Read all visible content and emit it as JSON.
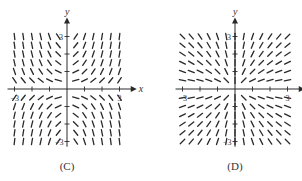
{
  "figure": {
    "panels": [
      {
        "id": "C",
        "caption": "(C)",
        "x_axis_label": "x",
        "y_axis_label": "y",
        "tick_labels": {
          "x_neg": "−3",
          "x_pos": "3",
          "y_pos": "3",
          "y_neg": "−3"
        },
        "field": "xy",
        "origin": [
          67,
          89
        ],
        "unit_px": 17.5,
        "grid_cols": [
          -3,
          -2.5,
          -2,
          -1.5,
          -1,
          -0.5,
          0.5,
          1,
          1.5,
          2,
          2.5,
          3
        ],
        "grid_rows": [
          3,
          2.5,
          2,
          1.5,
          1,
          0.5,
          -0.5,
          -1,
          -1.5,
          -2,
          -2.5,
          -3
        ]
      },
      {
        "id": "D",
        "caption": "(D)",
        "x_axis_label": "x",
        "y_axis_label": "y",
        "tick_labels": {
          "x_neg": "−3",
          "x_pos": "3",
          "y_pos": "3",
          "y_neg": "−3"
        },
        "field": "y_over_x",
        "origin": [
          84,
          89
        ],
        "unit_px": 17.5,
        "grid_cols": [
          -3,
          -2.5,
          -2,
          -1.5,
          -1,
          -0.5,
          0,
          0.5,
          1,
          1.5,
          2,
          2.5,
          3
        ],
        "grid_rows": [
          3,
          2.5,
          2,
          1.5,
          1,
          0.5,
          -0.5,
          -1,
          -1.5,
          -2,
          -2.5,
          -3
        ]
      }
    ],
    "colors": {
      "ink": "#2a2a2a",
      "background": "#ffffff"
    }
  }
}
